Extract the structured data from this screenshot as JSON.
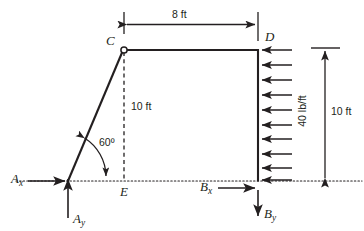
{
  "figure": {
    "type": "free-body-diagram",
    "title": "",
    "ink_color": "#231f20",
    "units": "ft",
    "joints": [
      {
        "name": "A",
        "kind": "pin-support",
        "x": 68,
        "y": 181,
        "label": "A"
      },
      {
        "name": "C",
        "kind": "pin-joint",
        "x": 124,
        "y": 50,
        "label": "C"
      },
      {
        "name": "D",
        "kind": "corner",
        "x": 258,
        "y": 50,
        "label": "D"
      },
      {
        "name": "E",
        "kind": "projection-point",
        "x": 124,
        "y": 181,
        "label": "E"
      },
      {
        "name": "B",
        "kind": "support",
        "x": 258,
        "y": 181,
        "label": "B"
      }
    ],
    "members": [
      {
        "name": "AC",
        "style": "solid",
        "from": "A",
        "to": "C"
      },
      {
        "name": "CD",
        "style": "solid",
        "from": "C",
        "to": "D"
      },
      {
        "name": "DB",
        "style": "solid",
        "from": "D",
        "to": "B"
      },
      {
        "name": "CE",
        "style": "dashed",
        "from": "C",
        "to": "E"
      }
    ],
    "baseline": {
      "name": "ground-reference-line",
      "style": "dotted",
      "y": 181
    }
  },
  "dimensions": {
    "top_span": {
      "label": "8 ft",
      "value": 8,
      "unit": "ft",
      "orientation": "horizontal",
      "from": "C",
      "to": "D"
    },
    "inner_height": {
      "label": "10 ft",
      "value": 10,
      "unit": "ft",
      "orientation": "vertical",
      "from": "C",
      "to": "E"
    },
    "right_height": {
      "label": "10 ft",
      "value": 10,
      "unit": "ft",
      "orientation": "vertical",
      "from": "D",
      "to": "B"
    }
  },
  "angle": {
    "label": "60º",
    "value": 60,
    "unit": "degrees",
    "at_joint": "A",
    "between": [
      "AC",
      "ground-reference-line"
    ]
  },
  "distributed_load": {
    "label": "40 lb/ft",
    "magnitude": 40,
    "unit": "lb/ft",
    "direction": "leftward",
    "applied_on": "DB",
    "arrow_count": 10
  },
  "reactions": [
    {
      "name": "Ax",
      "label_main": "A",
      "label_sub": "x",
      "direction": "right",
      "at": "A"
    },
    {
      "name": "Ay",
      "label_main": "A",
      "label_sub": "y",
      "direction": "up",
      "at": "A"
    },
    {
      "name": "Bx",
      "label_main": "B",
      "label_sub": "x",
      "direction": "right",
      "at": "B"
    },
    {
      "name": "By",
      "label_main": "B",
      "label_sub": "y",
      "direction": "down",
      "at": "B"
    }
  ]
}
